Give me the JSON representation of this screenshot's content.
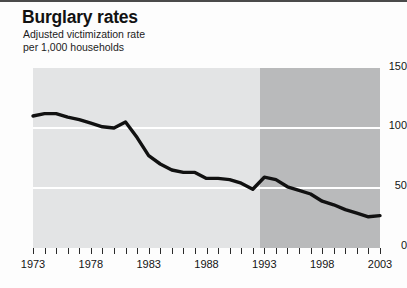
{
  "chart_data": {
    "type": "line",
    "title": "Burglary rates",
    "subtitle": "Adjusted victimization rate\nper 1,000 households",
    "xlabel": "",
    "ylabel": "",
    "xlim": [
      1973,
      2003
    ],
    "ylim": [
      0,
      150
    ],
    "yticks": [
      0,
      50,
      100,
      150
    ],
    "ytick_labels": [
      "0",
      "50",
      "100",
      "150"
    ],
    "xticks": [
      1973,
      1974,
      1975,
      1976,
      1977,
      1978,
      1979,
      1980,
      1981,
      1982,
      1983,
      1984,
      1985,
      1986,
      1987,
      1988,
      1989,
      1990,
      1991,
      1992,
      1993,
      1994,
      1995,
      1996,
      1997,
      1998,
      1999,
      2000,
      2001,
      2002,
      2003
    ],
    "xtick_labels": [
      "1973",
      "1978",
      "1983",
      "1988",
      "1993",
      "1998",
      "2003"
    ],
    "xtick_labeled_values": [
      1973,
      1978,
      1983,
      1988,
      1993,
      1998,
      2003
    ],
    "grid": "horizontal-white-at-50-and-100",
    "legend": "none",
    "line_color": "#111111",
    "line_width_px": 3.4,
    "background_bands": [
      {
        "name": "old-methodology",
        "from": 1973,
        "to": 1992.6,
        "color": "#e3e4e5"
      },
      {
        "name": "redesigned-survey",
        "from": 1992.6,
        "to": 2003,
        "color": "#b9babb"
      }
    ],
    "x": [
      1973,
      1974,
      1975,
      1976,
      1977,
      1978,
      1979,
      1980,
      1981,
      1982,
      1983,
      1984,
      1985,
      1986,
      1987,
      1988,
      1989,
      1990,
      1991,
      1992,
      1993,
      1994,
      1995,
      1996,
      1997,
      1998,
      1999,
      2000,
      2001,
      2002,
      2003
    ],
    "values": [
      110,
      112,
      112,
      109,
      107,
      104,
      101,
      100,
      105,
      92,
      77,
      70,
      65,
      63,
      63,
      58,
      58,
      57,
      54,
      49,
      59,
      57,
      51,
      48,
      45,
      39,
      36,
      32,
      29,
      26,
      27
    ],
    "series": [
      {
        "name": "Adjusted burglary victimization rate per 1,000 households",
        "values": [
          110,
          112,
          112,
          109,
          107,
          104,
          101,
          100,
          105,
          92,
          77,
          70,
          65,
          63,
          63,
          58,
          58,
          57,
          54,
          49,
          59,
          57,
          51,
          48,
          45,
          39,
          36,
          32,
          29,
          26,
          27
        ]
      }
    ]
  },
  "axes": {
    "y_labels": [
      "150",
      "100",
      "50",
      "0"
    ],
    "x_labels": [
      "1973",
      "1978",
      "1983",
      "1988",
      "1993",
      "1998",
      "2003"
    ]
  }
}
